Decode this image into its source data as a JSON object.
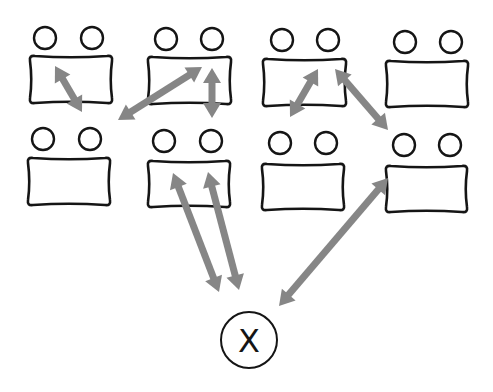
{
  "diagram": {
    "colors": {
      "outline": "#151515",
      "arrow": "#868686",
      "background": "#ffffff"
    },
    "tables": [
      {
        "id": "table-1",
        "row": 1,
        "col": 1,
        "x": 30,
        "y": 56,
        "w": 82,
        "h": 47,
        "chairs": [
          {
            "cx": 45,
            "cy": 38
          },
          {
            "cx": 92,
            "cy": 38
          }
        ]
      },
      {
        "id": "table-2",
        "row": 1,
        "col": 2,
        "x": 148,
        "y": 57,
        "w": 83,
        "h": 47,
        "chairs": [
          {
            "cx": 166,
            "cy": 39
          },
          {
            "cx": 212,
            "cy": 39
          }
        ]
      },
      {
        "id": "table-3",
        "row": 1,
        "col": 3,
        "x": 263,
        "y": 59,
        "w": 83,
        "h": 47,
        "chairs": [
          {
            "cx": 282,
            "cy": 40
          },
          {
            "cx": 328,
            "cy": 40
          }
        ]
      },
      {
        "id": "table-4",
        "row": 1,
        "col": 4,
        "x": 386,
        "y": 61,
        "w": 82,
        "h": 46,
        "chairs": [
          {
            "cx": 405,
            "cy": 42
          },
          {
            "cx": 451,
            "cy": 42
          }
        ]
      },
      {
        "id": "table-5",
        "row": 2,
        "col": 1,
        "x": 28,
        "y": 158,
        "w": 82,
        "h": 47,
        "chairs": [
          {
            "cx": 43,
            "cy": 139
          },
          {
            "cx": 90,
            "cy": 139
          }
        ]
      },
      {
        "id": "table-6",
        "row": 2,
        "col": 2,
        "x": 148,
        "y": 161,
        "w": 82,
        "h": 46,
        "chairs": [
          {
            "cx": 164,
            "cy": 141
          },
          {
            "cx": 211,
            "cy": 141
          }
        ]
      },
      {
        "id": "table-7",
        "row": 2,
        "col": 3,
        "x": 262,
        "y": 164,
        "w": 82,
        "h": 46,
        "chairs": [
          {
            "cx": 280,
            "cy": 143
          },
          {
            "cx": 326,
            "cy": 143
          }
        ]
      },
      {
        "id": "table-8",
        "row": 2,
        "col": 4,
        "x": 386,
        "y": 166,
        "w": 81,
        "h": 46,
        "chairs": [
          {
            "cx": 404,
            "cy": 145
          },
          {
            "cx": 450,
            "cy": 145
          }
        ]
      }
    ],
    "chair_radius": 11,
    "arrows": [
      {
        "id": "arrow-1",
        "type": "bidirectional",
        "from": [
          55,
          66
        ],
        "to": [
          82,
          112
        ],
        "connects": "table-1 internal"
      },
      {
        "id": "arrow-2",
        "type": "bidirectional",
        "from": [
          118,
          120
        ],
        "to": [
          202,
          67
        ],
        "connects": "table-1 to table-2"
      },
      {
        "id": "arrow-3",
        "type": "bidirectional",
        "from": [
          212,
          68
        ],
        "to": [
          212,
          118
        ],
        "connects": "table-2 to table-6"
      },
      {
        "id": "arrow-4",
        "type": "bidirectional",
        "from": [
          318,
          69
        ],
        "to": [
          290,
          117
        ],
        "connects": "table-3 internal"
      },
      {
        "id": "arrow-5",
        "type": "bidirectional",
        "from": [
          335,
          69
        ],
        "to": [
          388,
          130
        ],
        "connects": "table-3 to table-8"
      },
      {
        "id": "arrow-6",
        "type": "bidirectional",
        "from": [
          173,
          173
        ],
        "to": [
          219,
          292
        ],
        "connects": "table-6 to X"
      },
      {
        "id": "arrow-7",
        "type": "bidirectional",
        "from": [
          208,
          172
        ],
        "to": [
          239,
          290
        ],
        "connects": "table-6 to X"
      },
      {
        "id": "arrow-8",
        "type": "bidirectional",
        "from": [
          388,
          178
        ],
        "to": [
          279,
          306
        ],
        "connects": "table-8 to X"
      }
    ],
    "center_node": {
      "label": "X",
      "cx": 249,
      "cy": 340,
      "r": 28
    }
  }
}
